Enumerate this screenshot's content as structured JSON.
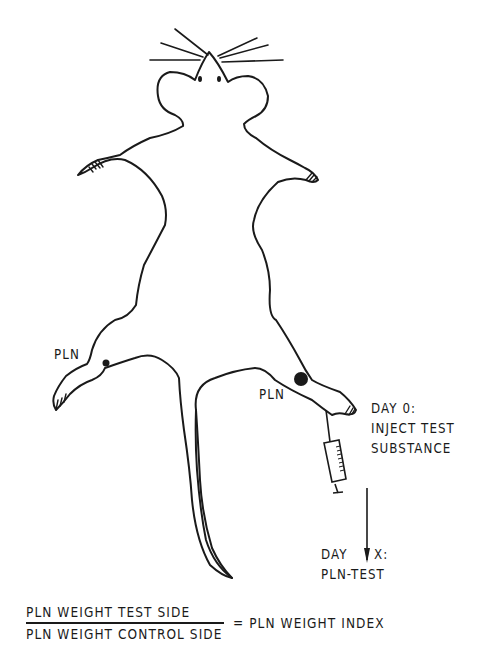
{
  "diagram": {
    "labels": {
      "pln_left": "PLN",
      "pln_right": "PLN",
      "day0_line1": "DAY 0:",
      "day0_line2": "INJECT TEST",
      "day0_line3": "SUBSTANCE",
      "dayx_line1_a": "DAY",
      "dayx_line1_b": "X:",
      "dayx_line2": "PLN-TEST"
    },
    "formula": {
      "numerator": "PLN WEIGHT TEST SIDE",
      "denominator": "PLN WEIGHT CONTROL SIDE",
      "result": "= PLN WEIGHT INDEX"
    },
    "colors": {
      "line": "#1a1a1a",
      "background": "#ffffff"
    },
    "icons": [
      "syringe-icon",
      "arrow-down-icon",
      "lymph-node-dot-icon"
    ]
  }
}
